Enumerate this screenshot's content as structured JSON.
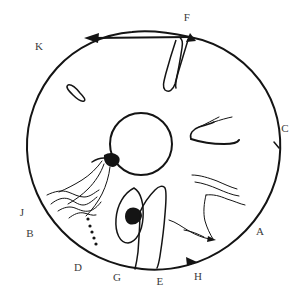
{
  "figure": {
    "canvas": {
      "width": 306,
      "height": 307
    },
    "colors": {
      "ink": "#141414",
      "label_ink": "#3b3b3b",
      "background": "#ffffff"
    }
  },
  "outer_circle": {
    "name": "outer-boundary-circle",
    "center_x": 152,
    "center_y": 152,
    "radius": 128
  },
  "inner_circle": {
    "name": "inner-core-circle",
    "center_x": 141,
    "center_y": 144,
    "radius": 31
  },
  "labels": [
    {
      "id": "F",
      "text": "F",
      "x": 187,
      "y": 17
    },
    {
      "id": "K",
      "text": "K",
      "x": 39,
      "y": 46
    },
    {
      "id": "C",
      "text": "C",
      "x": 285,
      "y": 128
    },
    {
      "id": "J",
      "text": "J",
      "x": 22,
      "y": 212
    },
    {
      "id": "A",
      "text": "A",
      "x": 260,
      "y": 231
    },
    {
      "id": "B",
      "text": "B",
      "x": 30,
      "y": 233
    },
    {
      "id": "D",
      "text": "D",
      "x": 78,
      "y": 267
    },
    {
      "id": "G",
      "text": "G",
      "x": 117,
      "y": 277
    },
    {
      "id": "E",
      "text": "E",
      "x": 160,
      "y": 281
    },
    {
      "id": "H",
      "text": "H",
      "x": 198,
      "y": 276
    }
  ],
  "annotations": {
    "top_chord_arrow": {
      "name": "top-chord-arrow",
      "description": "horizontal chord with leftward arrowhead spanning from K side to F"
    },
    "rim_arrow_h": {
      "name": "rim-arrow-h",
      "description": "arrowhead on outer rim near label H pointing clockwise"
    },
    "dot_series": {
      "name": "dot-series",
      "count": 5,
      "description": "diagonal series of small filled dots in sector D"
    },
    "core_blob": {
      "name": "core-blob-marker",
      "description": "dark triangular blob on lower-left of inner circle"
    },
    "lower_blob": {
      "name": "lower-blob-marker",
      "description": "dark blob at top of tilted ellipse in sector G/E"
    }
  }
}
